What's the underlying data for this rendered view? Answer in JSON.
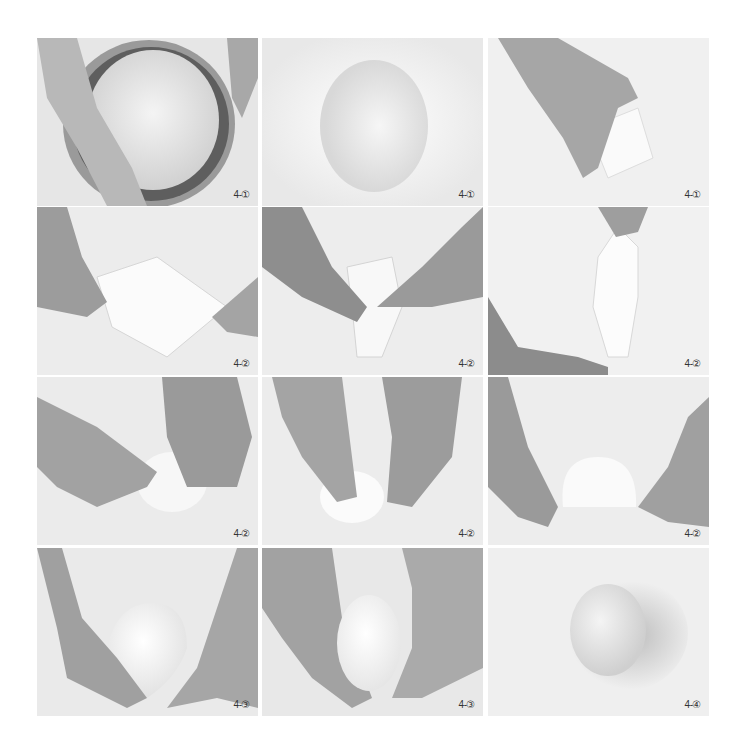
{
  "photos": [
    {
      "label": "4-①",
      "subject": "hands lifting dough out of metal bowl"
    },
    {
      "label": "4-①",
      "subject": "dough turned out onto surface"
    },
    {
      "label": "4-①",
      "subject": "hand flattening dough"
    },
    {
      "label": "4-②",
      "subject": "hands stretching dough into square"
    },
    {
      "label": "4-②",
      "subject": "hands folding dough corners to center"
    },
    {
      "label": "4-②",
      "subject": "hands stretching and twisting dough"
    },
    {
      "label": "4-②",
      "subject": "fingers pinching dough seam"
    },
    {
      "label": "4-②",
      "subject": "fingers tucking dough ball"
    },
    {
      "label": "4-②",
      "subject": "hands shaping dough ball"
    },
    {
      "label": "4-③",
      "subject": "hands cupping rounded dough"
    },
    {
      "label": "4-③",
      "subject": "hands holding smooth oval dough"
    },
    {
      "label": "4-④",
      "subject": "shaped dough resting on surface"
    }
  ]
}
